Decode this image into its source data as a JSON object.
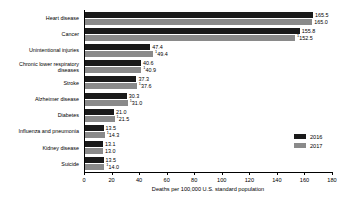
{
  "chart_data": {
    "type": "bar",
    "title": "",
    "xlabel": "Deaths per 100,000 U.S. standard population",
    "ylabel": "",
    "xlim": [
      0,
      180
    ],
    "xticks": [
      0,
      20,
      40,
      60,
      80,
      100,
      120,
      140,
      160,
      180
    ],
    "xtick_labels": [
      "0",
      "20",
      "40",
      "60",
      "80",
      "100",
      "120",
      "140",
      "160",
      "180"
    ],
    "grid": false,
    "orientation": "horizontal",
    "legend_position": "right",
    "categories": [
      "Heart disease",
      "Cancer",
      "Unintentional injuries",
      "Chronic lower respiratory\ndiseases",
      "Stroke",
      "Alzheimer disease",
      "Diabetes",
      "Influenza and pneumonia",
      "Kidney disease",
      "Suicide"
    ],
    "series": [
      {
        "name": "2016",
        "color": "#1a1a1a",
        "values": [
          165.5,
          155.8,
          47.4,
          40.6,
          37.3,
          30.3,
          21.0,
          13.5,
          13.1,
          13.5
        ],
        "labels": [
          "165.5",
          "155.8",
          "47.4",
          "40.6",
          "37.3",
          "30.3",
          "21.0",
          "13.5",
          "13.1",
          "13.5"
        ],
        "footnote_marks": [
          "",
          "",
          "",
          "",
          "",
          "",
          "",
          "",
          "",
          ""
        ]
      },
      {
        "name": "2017",
        "color": "#8a8a8a",
        "values": [
          165.0,
          152.5,
          49.4,
          40.9,
          37.6,
          31.0,
          21.5,
          14.3,
          13.0,
          14.0
        ],
        "labels": [
          "165.0",
          "152.5",
          "49.4",
          "40.9",
          "37.6",
          "31.0",
          "21.5",
          "14.3",
          "13.0",
          "14.0"
        ],
        "footnote_marks": [
          "",
          "1",
          "1",
          "1",
          "1",
          "1",
          "1",
          "1",
          "",
          "1"
        ]
      }
    ]
  },
  "legend": {
    "items": [
      {
        "label": "2016",
        "color": "#1a1a1a"
      },
      {
        "label": "2017",
        "color": "#8a8a8a"
      }
    ]
  }
}
